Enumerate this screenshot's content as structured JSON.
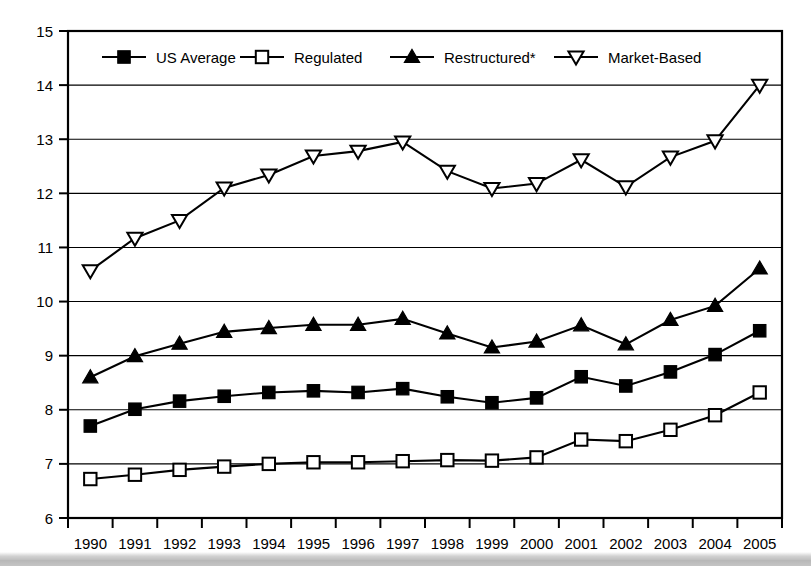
{
  "chart_data": {
    "type": "line",
    "title": "",
    "xlabel": "",
    "ylabel": "",
    "grid": true,
    "legend_position": "top-inside",
    "xlim": [
      "1990",
      "2005"
    ],
    "ylim": [
      6,
      15
    ],
    "ytick_step": 1,
    "yticks": [
      6,
      7,
      8,
      9,
      10,
      11,
      12,
      13,
      14,
      15
    ],
    "categories": [
      "1990",
      "1991",
      "1992",
      "1993",
      "1994",
      "1995",
      "1996",
      "1997",
      "1998",
      "1999",
      "2000",
      "2001",
      "2002",
      "2003",
      "2004",
      "2005"
    ],
    "series": [
      {
        "name": "US Average",
        "marker": "filled-square",
        "values": [
          7.7,
          8.01,
          8.16,
          8.25,
          8.32,
          8.35,
          8.32,
          8.39,
          8.24,
          8.13,
          8.22,
          8.61,
          8.44,
          8.7,
          9.02,
          9.46
        ]
      },
      {
        "name": "Regulated",
        "marker": "open-square",
        "values": [
          6.72,
          6.8,
          6.89,
          6.95,
          7.0,
          7.03,
          7.03,
          7.05,
          7.07,
          7.06,
          7.12,
          7.45,
          7.42,
          7.63,
          7.9,
          8.32
        ]
      },
      {
        "name": "Restructured*",
        "marker": "filled-triangle-up",
        "values": [
          8.6,
          8.99,
          9.22,
          9.44,
          9.51,
          9.57,
          9.57,
          9.68,
          9.41,
          9.15,
          9.26,
          9.56,
          9.21,
          9.66,
          9.92,
          10.61
        ]
      },
      {
        "name": "Market-Based",
        "marker": "open-triangle-down",
        "values": [
          10.57,
          11.17,
          11.5,
          12.1,
          12.34,
          12.69,
          12.78,
          12.95,
          12.41,
          12.09,
          12.18,
          12.62,
          12.12,
          12.67,
          12.97,
          14.0
        ]
      }
    ],
    "legend": [
      {
        "label": "US Average",
        "marker": "filled-square"
      },
      {
        "label": "Regulated",
        "marker": "open-square"
      },
      {
        "label": "Restructured*",
        "marker": "filled-triangle-up"
      },
      {
        "label": "Market-Based",
        "marker": "open-triangle-down"
      }
    ],
    "colors": {
      "line": "#000000",
      "grid": "#000000",
      "axis": "#000000",
      "background": "#ffffff"
    }
  }
}
